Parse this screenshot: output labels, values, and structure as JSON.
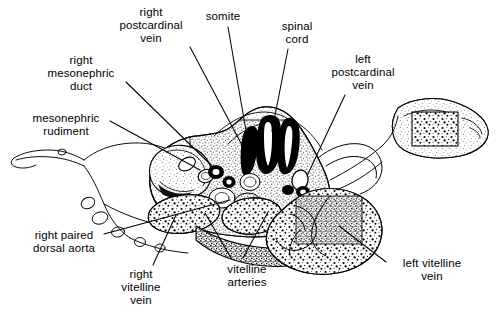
{
  "figure": {
    "kind": "anatomical-line-drawing",
    "background_color": "#ffffff",
    "ink_color": "#000000"
  },
  "labels": [
    {
      "id": "right-postcardinal-vein",
      "text": "right\npostcardinal\nvein",
      "x": 108,
      "y": 6,
      "w": 86,
      "align": "center",
      "leader": [
        [
          190,
          47
        ],
        [
          243,
          147
        ]
      ]
    },
    {
      "id": "somite",
      "text": "somite",
      "x": 192,
      "y": 10,
      "w": 62,
      "align": "center",
      "leader": [
        [
          228,
          27
        ],
        [
          252,
          165
        ]
      ]
    },
    {
      "id": "spinal-cord",
      "text": "spinal\ncord",
      "x": 269,
      "y": 20,
      "w": 56,
      "align": "center",
      "leader": [
        [
          288,
          49
        ],
        [
          272,
          131
        ]
      ]
    },
    {
      "id": "left-postcardinal-vein",
      "text": "left\npostcardinal\nvein",
      "x": 320,
      "y": 53,
      "w": 86,
      "align": "center",
      "leader": [
        [
          345,
          95
        ],
        [
          307,
          176
        ]
      ]
    },
    {
      "id": "right-mesonephric-duct",
      "text": "right\nmesonephric\nduct",
      "x": 36,
      "y": 54,
      "w": 90,
      "align": "center",
      "leader": [
        [
          126,
          82
        ],
        [
          212,
          166
        ]
      ]
    },
    {
      "id": "mesonephric-rudiment",
      "text": "mesonephric\nrudiment",
      "x": 20,
      "y": 112,
      "w": 92,
      "align": "center",
      "leader": [
        [
          110,
          121
        ],
        [
          200,
          170
        ]
      ]
    },
    {
      "id": "right-paired-dorsal-aorta",
      "text": "right paired\ndorsal aorta",
      "x": 18,
      "y": 229,
      "w": 92,
      "align": "center",
      "leader": [
        [
          104,
          234
        ],
        [
          230,
          200
        ]
      ]
    },
    {
      "id": "right-vitelline-vein",
      "text": "right\nvitelline\nvein",
      "x": 110,
      "y": 268,
      "w": 62,
      "align": "center",
      "leader": [
        [
          153,
          265
        ],
        [
          176,
          215
        ]
      ]
    },
    {
      "id": "vitelline-arteries",
      "text": "vitelline\narteries",
      "x": 212,
      "y": 263,
      "w": 70,
      "align": "center",
      "leader": [
        [
          231,
          258
        ],
        [
          205,
          213
        ]
      ],
      "leader2": [
        [
          243,
          258
        ],
        [
          268,
          212
        ]
      ]
    },
    {
      "id": "left-vitelline-vein",
      "text": "left vitelline\nvein",
      "x": 388,
      "y": 257,
      "w": 88,
      "align": "center",
      "leader": [
        [
          386,
          262
        ],
        [
          339,
          226
        ]
      ]
    }
  ]
}
